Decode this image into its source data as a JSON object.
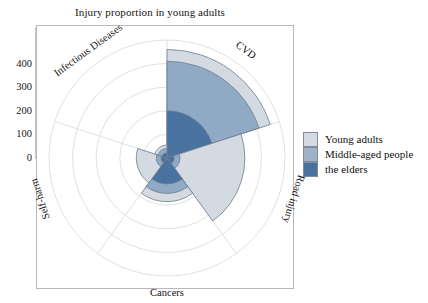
{
  "chart_data": {
    "type": "bar",
    "subtype": "polar-stacked-rose",
    "title": "Injury proportion in young adults",
    "xlabel": "",
    "ylabel": "",
    "categories": [
      "CVD",
      "Road injury",
      "Cancers",
      "Self-harm",
      "Infectious Diseases"
    ],
    "series": [
      {
        "name": "the elders",
        "color": "#4a72a0",
        "values": [
          200,
          30,
          110,
          25,
          22
        ]
      },
      {
        "name": "Middle-aged people",
        "color": "#90a9c4",
        "values": [
          410,
          55,
          150,
          45,
          40
        ]
      },
      {
        "name": "Young adults",
        "color": "#d3dae1",
        "values": [
          460,
          330,
          185,
          130,
          55
        ]
      }
    ],
    "stacked_totals": [
      460,
      330,
      185,
      130,
      55
    ],
    "ylim": [
      0,
      500
    ],
    "yticks": [
      0,
      100,
      200,
      300,
      400
    ],
    "ytick_labels": [
      "0",
      "100",
      "200",
      "300",
      "400"
    ],
    "grid": true,
    "grid_rings": [
      100,
      200,
      300,
      400,
      500
    ],
    "legend_position": "right",
    "sector_span_degrees": 72,
    "start_angle_degrees": 90,
    "direction": "clockwise"
  },
  "title": {
    "text": "Injury proportion in young adults"
  },
  "axis": {
    "ticks": [
      {
        "label": "400",
        "value": 400
      },
      {
        "label": "300",
        "value": 300
      },
      {
        "label": "200",
        "value": 200
      },
      {
        "label": "100",
        "value": 100
      },
      {
        "label": "0",
        "value": 0
      }
    ]
  },
  "category_labels": [
    {
      "text": "CVD",
      "rotation": 36
    },
    {
      "text": "Road injury",
      "rotation": 108
    },
    {
      "text": "Cancers",
      "rotation": 0
    },
    {
      "text": "Self-harm",
      "rotation": -108
    },
    {
      "text": "Infectious Diseases",
      "rotation": -36
    }
  ],
  "legend": {
    "items": [
      {
        "label": "Young adults",
        "color": "#d3dae1"
      },
      {
        "label": "Middle-aged people",
        "color": "#9fb3c8"
      },
      {
        "label": "the elders",
        "color": "#4a72a0"
      }
    ]
  },
  "colors": {
    "young_adults": "#d3dae1",
    "middle_aged": "#90a9c4",
    "elders": "#4a72a0",
    "grid": "#d8dde2",
    "sector_stroke": "#6d7d8e",
    "frame": "#b9b9b9"
  }
}
